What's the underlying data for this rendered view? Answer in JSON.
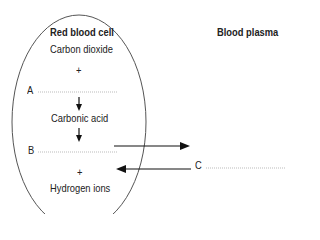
{
  "diagram": {
    "cell_title": "Red blood cell",
    "plasma_title": "Blood plasma",
    "carbon_dioxide": "Carbon dioxide",
    "plus_1": "+",
    "label_a": "A",
    "carbonic_acid": "Carbonic acid",
    "label_b": "B",
    "plus_2": "+",
    "hydrogen_ions": "Hydrogen ions",
    "label_c": "C"
  }
}
